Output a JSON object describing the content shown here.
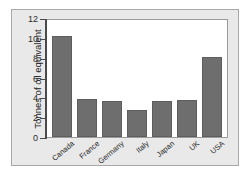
{
  "chart_data": {
    "type": "bar",
    "title": "",
    "xlabel": "",
    "ylabel": "Tonnes of oil equivalent",
    "categories": [
      "Canada",
      "France",
      "Germany",
      "Italy",
      "Japan",
      "UK",
      "USA"
    ],
    "values": [
      10.2,
      3.85,
      3.6,
      2.75,
      3.65,
      3.75,
      8.05
    ],
    "ylim": [
      0,
      12
    ],
    "yticks": [
      0,
      2,
      4,
      6,
      8,
      10,
      12
    ],
    "ytick_labels": [
      "0",
      "2",
      "4",
      "6",
      "8",
      "10",
      "12"
    ],
    "grid": false,
    "legend": "none",
    "bar_color": "#6e6e6e",
    "bar_edge_color": "#5d5d5d",
    "plot_background": "#ffffff",
    "figure_background": "#e9e9e9",
    "axis_color": "#4a4a4a",
    "text_color": "#2b2b2b"
  }
}
